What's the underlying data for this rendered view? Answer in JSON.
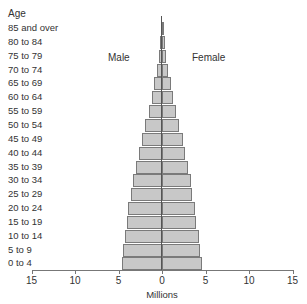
{
  "chart_data": {
    "type": "bar",
    "orientation": "horizontal-population-pyramid",
    "title": "",
    "ylabel": "Age",
    "xlabel": "Millions",
    "xlim": [
      -15,
      15
    ],
    "x_ticks": [
      15,
      10,
      5,
      0,
      5,
      10,
      15
    ],
    "grid": false,
    "legend": [
      "Male",
      "Female"
    ],
    "categories": [
      "85 and over",
      "80 to 84",
      "75 to 79",
      "70 to 74",
      "65 to 69",
      "60 to 64",
      "55 to 59",
      "50 to 54",
      "45 to 49",
      "40 to 44",
      "35 to 39",
      "30 to 34",
      "25 to 29",
      "20 to 24",
      "15 to 19",
      "10 to 14",
      "5 to 9",
      "0 to 4"
    ],
    "series": [
      {
        "name": "Male",
        "side": "left",
        "values": [
          0.1,
          0.2,
          0.4,
          0.6,
          0.9,
          1.2,
          1.5,
          1.9,
          2.3,
          2.7,
          3.0,
          3.3,
          3.6,
          3.9,
          4.0,
          4.3,
          4.5,
          4.6
        ]
      },
      {
        "name": "Female",
        "side": "right",
        "values": [
          0.2,
          0.3,
          0.5,
          0.7,
          1.0,
          1.3,
          1.6,
          2.0,
          2.4,
          2.7,
          3.0,
          3.3,
          3.5,
          3.8,
          3.9,
          4.2,
          4.4,
          4.6
        ]
      }
    ]
  },
  "labels": {
    "age": "Age",
    "male": "Male",
    "female": "Female",
    "xlabel": "Millions",
    "ticks": [
      "15",
      "10",
      "5",
      "0",
      "5",
      "10",
      "15"
    ]
  }
}
